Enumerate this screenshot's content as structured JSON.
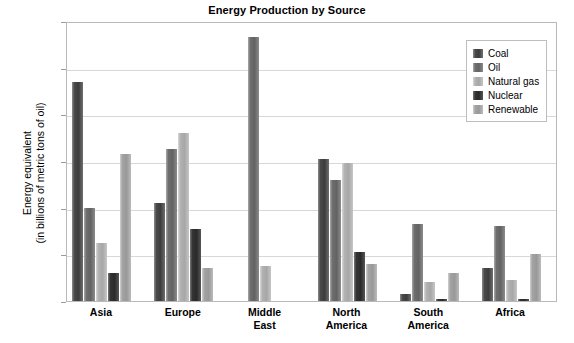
{
  "chart_data": {
    "type": "bar",
    "title": "Energy Production by Source",
    "xlabel": "",
    "ylabel": "Energy equivalent\n(in billions of metric tons of oil)",
    "ylabel_line1": "Energy equivalent",
    "ylabel_line2": "(in billions of metric tons of oil)",
    "categories": [
      "Asia",
      "Europe",
      "Middle East",
      "North America",
      "South America",
      "Africa"
    ],
    "category_lines": [
      [
        "Asia"
      ],
      [
        "Europe"
      ],
      [
        "Middle",
        "East"
      ],
      [
        "North",
        "America"
      ],
      [
        "South",
        "America"
      ],
      [
        "Africa"
      ]
    ],
    "series": [
      {
        "name": "Coal",
        "color": "#454545",
        "values": [
          0.94,
          0.42,
          0.0,
          0.61,
          0.03,
          0.14
        ]
      },
      {
        "name": "Oil",
        "color": "#6b6b6b",
        "values": [
          0.4,
          0.65,
          1.13,
          0.52,
          0.33,
          0.32
        ]
      },
      {
        "name": "Natural gas",
        "color": "#b0b0b0",
        "values": [
          0.25,
          0.72,
          0.15,
          0.59,
          0.08,
          0.09
        ]
      },
      {
        "name": "Nuclear",
        "color": "#303030",
        "values": [
          0.12,
          0.31,
          0.0,
          0.21,
          0.01,
          0.01
        ]
      },
      {
        "name": "Renewable",
        "color": "#a0a0a0",
        "values": [
          0.63,
          0.14,
          0.0,
          0.16,
          0.12,
          0.2
        ]
      }
    ],
    "ylim": [
      0,
      1.2
    ],
    "yticks": [
      0,
      0.2,
      0.4,
      0.6,
      0.8,
      1.0,
      1.2
    ],
    "ytick_labels": [
      "0",
      "0.2",
      "0.4",
      "0.6",
      "0.8",
      "1.0",
      "1.2"
    ],
    "grid": true,
    "legend_position": "upper right",
    "legend_entries": [
      "Coal",
      "Oil",
      "Natural gas",
      "Nuclear",
      "Renewable"
    ]
  }
}
